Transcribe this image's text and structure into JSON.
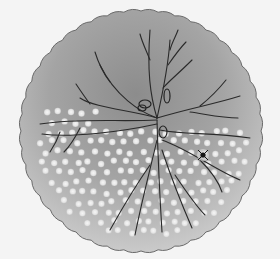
{
  "image": {
    "description": "Scientific illustration of a branching neuron (dendritic tree) drawn over a circular disc with a scalloped edge; a field of white dots fills the lower half of the disc.",
    "background_color": "#f4f4f4",
    "disc": {
      "cx": 141,
      "cy": 131,
      "radius": 120,
      "edge_color": "#6a6a6a",
      "fill_outer": "#c4c4c4",
      "fill_inner": "#8a8a8a",
      "edge_style": "scalloped"
    },
    "neuron": {
      "line_color": "#2a2a2a",
      "center": [
        157,
        118
      ]
    },
    "dots": {
      "color": "#eeeeee",
      "region": "lower half of disc"
    },
    "marker": {
      "type": "dark star spot",
      "position": [
        203,
        155
      ],
      "color": "#1a1a1a"
    }
  }
}
